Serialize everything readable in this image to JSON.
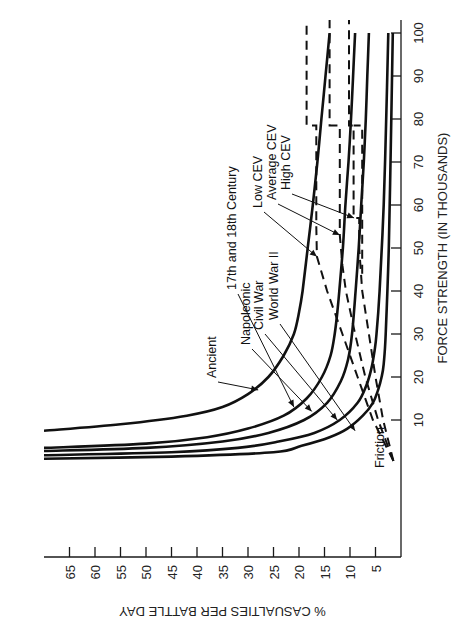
{
  "chart_data": {
    "type": "line",
    "orientation": "rotated 90deg counterclockwise",
    "xlabel": "FORCE STRENGTH (IN THOUSANDS)",
    "ylabel": "% CASUALTIES PER BATTLE DAY",
    "x_ticks": [
      10,
      20,
      30,
      40,
      50,
      60,
      70,
      80,
      90,
      100
    ],
    "y_ticks": [
      5,
      10,
      15,
      20,
      25,
      30,
      35,
      40,
      45,
      50,
      55,
      60,
      65
    ],
    "xlim": [
      0,
      103
    ],
    "ylim": [
      0,
      70
    ],
    "grid": false,
    "series": [
      {
        "name": "Ancient",
        "style": "solid",
        "x": [
          7.5,
          9,
          11,
          13,
          16,
          20,
          25,
          30,
          35,
          40,
          50,
          60,
          70,
          80,
          90,
          100
        ],
        "y": [
          70,
          55,
          42,
          35,
          30,
          26,
          23,
          21,
          20,
          19.3,
          18.3,
          17.3,
          16.4,
          15.6,
          14.8,
          14
        ]
      },
      {
        "name": "17th and 18th Century",
        "style": "solid",
        "x": [
          3.5,
          4.5,
          6,
          8,
          11,
          15,
          20,
          25,
          30,
          35,
          40,
          50,
          60,
          70,
          80,
          90,
          100
        ],
        "y": [
          70,
          50,
          38,
          30,
          23,
          18.5,
          15.5,
          13.8,
          13,
          12.5,
          12.1,
          11.4,
          10.9,
          10.3,
          9.8,
          9.4,
          9
        ]
      },
      {
        "name": "Napoleonic",
        "style": "solid",
        "x": [
          2.8,
          3.5,
          5,
          7,
          10,
          14,
          19,
          24,
          30,
          40,
          50,
          60,
          70,
          80,
          90,
          100
        ],
        "y": [
          70,
          50,
          35,
          26,
          19,
          14.5,
          11.8,
          10.4,
          9.6,
          8.9,
          8.3,
          7.8,
          7.3,
          6.9,
          6.6,
          6.3
        ]
      },
      {
        "name": "Civil War",
        "style": "solid",
        "x": [
          1.8,
          2.5,
          3.5,
          5,
          7,
          10,
          14,
          18,
          22,
          26,
          30,
          40,
          60,
          80,
          100
        ],
        "y": [
          70,
          45,
          32,
          24,
          17,
          12,
          8.5,
          6.8,
          5.8,
          5.2,
          4.8,
          4.2,
          3.4,
          2.9,
          2.5
        ]
      },
      {
        "name": "World War II",
        "style": "solid",
        "x": [
          1,
          1.5,
          2.5,
          4,
          6,
          8,
          11,
          14,
          17,
          20,
          23,
          30,
          50,
          80,
          100
        ],
        "y": [
          70,
          45,
          25,
          19.5,
          14,
          10.5,
          7.5,
          5.5,
          4.5,
          3.8,
          3.4,
          3,
          2.4,
          1.9,
          1.6
        ]
      },
      {
        "name": "Low CEV (Friction)",
        "style": "dashed",
        "x": [
          0.5,
          10,
          20,
          30,
          40,
          48,
          55,
          65,
          78.5,
          78.5,
          103
        ],
        "y": [
          1.5,
          5.5,
          8.5,
          11.5,
          14.5,
          16.5,
          16.6,
          16.6,
          16.6,
          18.5,
          18.5
        ]
      },
      {
        "name": "Average CEV (Friction)",
        "style": "dashed",
        "x": [
          0.5,
          10,
          20,
          30,
          40,
          46,
          53,
          65,
          78.5,
          78.5,
          103
        ],
        "y": [
          1.5,
          4.5,
          7,
          9,
          10.8,
          11.5,
          12,
          12,
          12,
          14,
          14
        ]
      },
      {
        "name": "High CEV (Friction)",
        "style": "dashed",
        "x": [
          0.5,
          10,
          20,
          30,
          40,
          50,
          57,
          57,
          78.5,
          78.5,
          103
        ],
        "y": [
          1.5,
          3.5,
          5,
          6.3,
          7.6,
          8.2,
          8.2,
          9.3,
          9.3,
          10.2,
          10.2
        ]
      },
      {
        "name": "Lower CEV step",
        "style": "dashed",
        "x": [
          44,
          60,
          78.5,
          78.5
        ],
        "y": [
          7.6,
          7.6,
          7.6,
          9.3
        ]
      }
    ],
    "annotations": [
      {
        "text": "Ancient",
        "arrow_to": [
          17,
          28
        ]
      },
      {
        "text": "17th and 18th Century",
        "arrow_to": [
          13,
          21
        ]
      },
      {
        "text": "Napoleonic",
        "arrow_to": [
          12,
          17.5
        ]
      },
      {
        "text": "Civil War",
        "arrow_to": [
          10,
          12.5
        ]
      },
      {
        "text": "World War II",
        "arrow_to": [
          7.5,
          9
        ]
      },
      {
        "text": "Low CEV",
        "arrow_to": [
          48,
          16.5
        ]
      },
      {
        "text": "Average CEV",
        "arrow_to": [
          53,
          12
        ]
      },
      {
        "text": "High CEV",
        "arrow_to": [
          57,
          9.2
        ]
      },
      {
        "text": "Friction",
        "arrow_to": null
      }
    ]
  }
}
